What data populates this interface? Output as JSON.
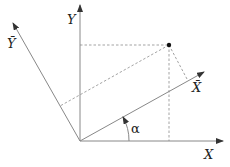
{
  "diagram": {
    "labels": {
      "y_axis": "Y",
      "x_axis": "X",
      "y_bar": "Ȳ",
      "x_bar": "X̄",
      "angle": "α"
    },
    "colors": {
      "axis": "#888888",
      "dashed": "#999999",
      "point": "#111111",
      "text": "#222222"
    }
  }
}
